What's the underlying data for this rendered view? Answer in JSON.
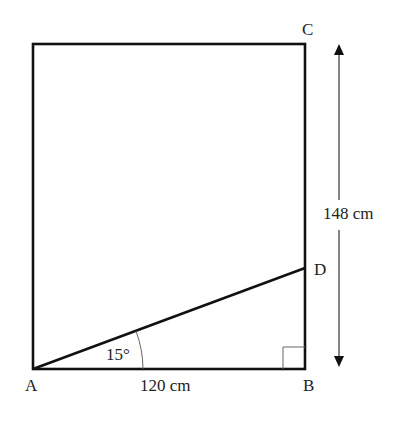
{
  "diagram": {
    "points": {
      "A": "A",
      "B": "B",
      "C": "C",
      "D": "D"
    },
    "labels": {
      "base_length": "120 cm",
      "height_length": "148 cm",
      "angle": "15°"
    },
    "colors": {
      "line": "#111111",
      "thin": "#666666",
      "background": "#ffffff"
    }
  }
}
